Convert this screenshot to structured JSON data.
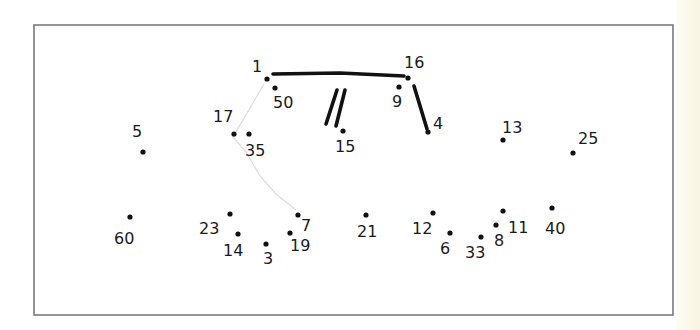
{
  "worksheet": {
    "type": "connect-the-dots",
    "frame": {
      "x": 34,
      "y": 25,
      "width": 639,
      "height": 290
    },
    "dots": [
      {
        "label": "1",
        "x": 267,
        "y": 79,
        "lx": 252,
        "ly": 72
      },
      {
        "label": "50",
        "x": 275,
        "y": 88,
        "lx": 273,
        "ly": 108
      },
      {
        "label": "16",
        "x": 408,
        "y": 78,
        "lx": 404,
        "ly": 68
      },
      {
        "label": "9",
        "x": 399,
        "y": 87,
        "lx": 392,
        "ly": 107
      },
      {
        "label": "17",
        "x": 234,
        "y": 134,
        "lx": 213,
        "ly": 122
      },
      {
        "label": "35",
        "x": 249,
        "y": 134,
        "lx": 245,
        "ly": 156
      },
      {
        "label": "15",
        "x": 343,
        "y": 131,
        "lx": 335,
        "ly": 152
      },
      {
        "label": "4",
        "x": 428,
        "y": 132,
        "lx": 433,
        "ly": 129
      },
      {
        "label": "13",
        "x": 503,
        "y": 140,
        "lx": 502,
        "ly": 133
      },
      {
        "label": "25",
        "x": 573,
        "y": 153,
        "lx": 578,
        "ly": 144
      },
      {
        "label": "5",
        "x": 143,
        "y": 152,
        "lx": 132,
        "ly": 137
      },
      {
        "label": "60",
        "x": 130,
        "y": 217,
        "lx": 114,
        "ly": 244
      },
      {
        "label": "23",
        "x": 230,
        "y": 214,
        "lx": 199,
        "ly": 234
      },
      {
        "label": "14",
        "x": 238,
        "y": 234,
        "lx": 223,
        "ly": 256
      },
      {
        "label": "3",
        "x": 266,
        "y": 244,
        "lx": 263,
        "ly": 264
      },
      {
        "label": "19",
        "x": 290,
        "y": 233,
        "lx": 290,
        "ly": 251
      },
      {
        "label": "7",
        "x": 298,
        "y": 215,
        "lx": 301,
        "ly": 231
      },
      {
        "label": "21",
        "x": 366,
        "y": 215,
        "lx": 357,
        "ly": 237
      },
      {
        "label": "12",
        "x": 433,
        "y": 213,
        "lx": 412,
        "ly": 234
      },
      {
        "label": "6",
        "x": 450,
        "y": 233,
        "lx": 440,
        "ly": 254
      },
      {
        "label": "33",
        "x": 481,
        "y": 237,
        "lx": 465,
        "ly": 258
      },
      {
        "label": "8",
        "x": 496,
        "y": 225,
        "lx": 494,
        "ly": 246
      },
      {
        "label": "11",
        "x": 503,
        "y": 211,
        "lx": 508,
        "ly": 233
      },
      {
        "label": "40",
        "x": 552,
        "y": 208,
        "lx": 545,
        "ly": 234
      }
    ],
    "drawn_lines": [
      {
        "style": "thick",
        "points": [
          [
            273,
            74
          ],
          [
            340,
            73
          ],
          [
            404,
            76
          ]
        ]
      },
      {
        "style": "thick",
        "points": [
          [
            414,
            86
          ],
          [
            427,
            129
          ]
        ]
      },
      {
        "style": "thick",
        "points": [
          [
            337,
            90
          ],
          [
            326,
            124
          ]
        ]
      },
      {
        "style": "thick",
        "points": [
          [
            345,
            90
          ],
          [
            336,
            126
          ]
        ]
      },
      {
        "style": "faint",
        "points": [
          [
            264,
            84
          ],
          [
            233,
            137
          ],
          [
            246,
            152
          ],
          [
            260,
            176
          ],
          [
            276,
            194
          ],
          [
            296,
            210
          ]
        ]
      }
    ]
  }
}
